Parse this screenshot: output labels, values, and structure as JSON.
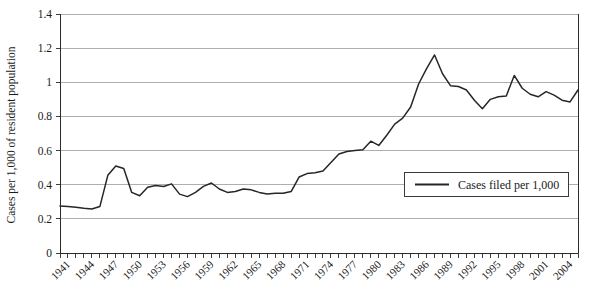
{
  "chart_data": {
    "type": "line",
    "title": "",
    "xlabel": "",
    "ylabel": "Cases per 1,000 of resident population",
    "ylim": [
      0,
      1.4
    ],
    "ytick_step": 0.2,
    "ytick_labels": [
      "0",
      "0.2",
      "0.4",
      "0.6",
      "0.8",
      "1",
      "1.2",
      "1.4"
    ],
    "ytick_values": [
      0,
      0.2,
      0.4,
      0.6,
      0.8,
      1.0,
      1.2,
      1.4
    ],
    "xlim": [
      1941,
      2006
    ],
    "xtick_label_step": 3,
    "xtick_labels": [
      "1941",
      "1944",
      "1947",
      "1950",
      "1953",
      "1956",
      "1959",
      "1962",
      "1965",
      "1968",
      "1971",
      "1974",
      "1977",
      "1980",
      "1983",
      "1986",
      "1989",
      "1992",
      "1995",
      "1998",
      "2001",
      "2004"
    ],
    "grid": "horizontal",
    "legend_position": "inside-lower-right",
    "series": [
      {
        "name": "Cases filed per 1,000",
        "color": "#262626",
        "x": [
          1941,
          1942,
          1943,
          1944,
          1945,
          1946,
          1947,
          1948,
          1949,
          1950,
          1951,
          1952,
          1953,
          1954,
          1955,
          1956,
          1957,
          1958,
          1959,
          1960,
          1961,
          1962,
          1963,
          1964,
          1965,
          1966,
          1967,
          1968,
          1969,
          1970,
          1971,
          1972,
          1973,
          1974,
          1975,
          1976,
          1977,
          1978,
          1979,
          1980,
          1981,
          1982,
          1983,
          1984,
          1985,
          1986,
          1987,
          1988,
          1989,
          1990,
          1991,
          1992,
          1993,
          1994,
          1995,
          1996,
          1997,
          1998,
          1999,
          2000,
          2001,
          2002,
          2003,
          2004,
          2005,
          2006
        ],
        "values": [
          0.275,
          0.272,
          0.268,
          0.262,
          0.258,
          0.272,
          0.455,
          0.51,
          0.495,
          0.355,
          0.335,
          0.385,
          0.395,
          0.39,
          0.405,
          0.345,
          0.33,
          0.355,
          0.39,
          0.41,
          0.375,
          0.355,
          0.36,
          0.375,
          0.37,
          0.355,
          0.345,
          0.35,
          0.35,
          0.36,
          0.445,
          0.465,
          0.47,
          0.48,
          0.53,
          0.58,
          0.595,
          0.6,
          0.605,
          0.655,
          0.63,
          0.69,
          0.755,
          0.79,
          0.855,
          0.99,
          1.08,
          1.16,
          1.05,
          0.98,
          0.975,
          0.955,
          0.895,
          0.845,
          0.9,
          0.915,
          0.92,
          1.04,
          0.965,
          0.93,
          0.915,
          0.945,
          0.925,
          0.895,
          0.885,
          0.955
        ]
      }
    ]
  },
  "legend": {
    "entries": [
      {
        "label": "Cases filed per 1,000"
      }
    ]
  }
}
